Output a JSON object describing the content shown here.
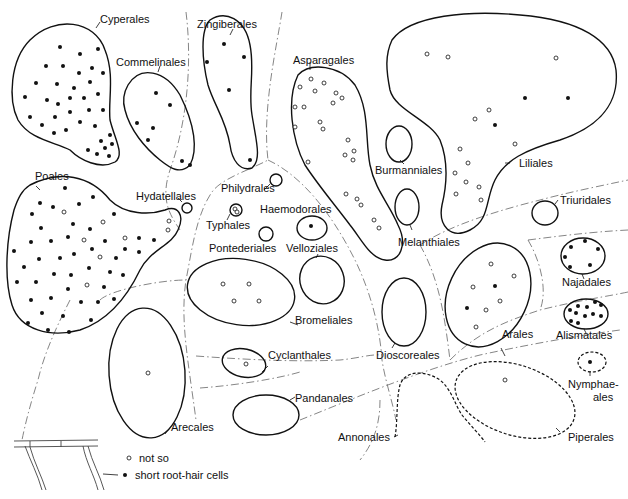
{
  "diagram": {
    "legend": {
      "open_label": "not so",
      "filled_label": "short root-hair cells"
    },
    "orders": [
      {
        "id": "cyperales",
        "label": "Cyperales",
        "filled": 38,
        "open": 0
      },
      {
        "id": "commelinales",
        "label": "Commelinales",
        "filled": 7,
        "open": 0
      },
      {
        "id": "zingiberales",
        "label": "Zingiberales",
        "filled": 5,
        "open": 0
      },
      {
        "id": "asparagales",
        "label": "Asparagales",
        "filled": 0,
        "open": 27
      },
      {
        "id": "liliales",
        "label": "Liliales",
        "filled": 3,
        "open": 16
      },
      {
        "id": "burmanniales",
        "label": "Burmanniales",
        "filled": 0,
        "open": 0
      },
      {
        "id": "melanthiales",
        "label": "Melanthiales",
        "filled": 0,
        "open": 0
      },
      {
        "id": "poales",
        "label": "Poales",
        "filled": 52,
        "open": 9
      },
      {
        "id": "hydatellales",
        "label": "Hydatellales",
        "filled": 0,
        "open": 0
      },
      {
        "id": "philydrales",
        "label": "Philydrales",
        "filled": 0,
        "open": 0
      },
      {
        "id": "typhales",
        "label": "Typhales",
        "filled": 0,
        "open": 0
      },
      {
        "id": "haemodorales",
        "label": "Haemodorales",
        "filled": 1,
        "open": 0
      },
      {
        "id": "pontederiales",
        "label": "Pontederiales",
        "filled": 0,
        "open": 0
      },
      {
        "id": "velloziales",
        "label": "Velloziales",
        "filled": 0,
        "open": 0
      },
      {
        "id": "bromeliales",
        "label": "Bromeliales",
        "filled": 0,
        "open": 4
      },
      {
        "id": "triuridales",
        "label": "Triuridales",
        "filled": 0,
        "open": 0
      },
      {
        "id": "najadales",
        "label": "Najadales",
        "filled": 6,
        "open": 0
      },
      {
        "id": "alismatales",
        "label": "Alismatales",
        "filled": 11,
        "open": 0
      },
      {
        "id": "arales",
        "label": "Arales",
        "filled": 2,
        "open": 5
      },
      {
        "id": "dioscoreales",
        "label": "Dioscoreales",
        "filled": 0,
        "open": 0
      },
      {
        "id": "cyclanthales",
        "label": "Cyclanthales",
        "filled": 0,
        "open": 1
      },
      {
        "id": "pandanales",
        "label": "Pandanales",
        "filled": 0,
        "open": 0
      },
      {
        "id": "arecales",
        "label": "Arecales",
        "filled": 0,
        "open": 1
      },
      {
        "id": "nymphaeales",
        "label": "Nymphae-\nales",
        "label_line1": "Nymphae-",
        "label_line2": "ales",
        "filled": 1,
        "open": 0
      },
      {
        "id": "piperales",
        "label": "Piperales",
        "filled": 0,
        "open": 1
      },
      {
        "id": "annonales",
        "label": "Annonales",
        "filled": 0,
        "open": 0
      }
    ],
    "colors": {
      "ink": "#111111",
      "divider": "#777777",
      "background": "#ffffff"
    }
  }
}
